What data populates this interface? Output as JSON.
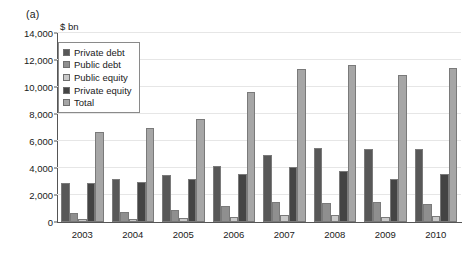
{
  "panel": {
    "label": "(a)",
    "unit_label": "$ bn"
  },
  "colors": {
    "private_debt": "#585858",
    "public_debt": "#8f8f8f",
    "public_equity": "#c9c9c9",
    "private_equity": "#444444",
    "total": "#a6a6a6",
    "axis": "#555555",
    "grid": "#e6e6e6"
  },
  "chart_data": {
    "type": "bar",
    "title": "",
    "subtitle": "",
    "xlabel": "",
    "ylabel": "$ bn",
    "ylim": [
      0,
      14000
    ],
    "yticks": [
      0,
      2000,
      4000,
      6000,
      8000,
      10000,
      12000,
      14000
    ],
    "ytick_labels": [
      "0",
      "2,000",
      "4,000",
      "6,000",
      "8,000",
      "10,000",
      "12,000",
      "14,000"
    ],
    "grid": true,
    "legend_position": "upper-left-inside",
    "categories": [
      "2003",
      "2004",
      "2005",
      "2006",
      "2007",
      "2008",
      "2009",
      "2010"
    ],
    "series": [
      {
        "name": "Private debt",
        "color": "#585858",
        "values": [
          2900,
          3200,
          3500,
          4150,
          5000,
          5450,
          5400,
          5400
        ]
      },
      {
        "name": "Public debt",
        "color": "#8f8f8f",
        "values": [
          700,
          750,
          900,
          1200,
          1500,
          1400,
          1500,
          1300
        ]
      },
      {
        "name": "Public equity",
        "color": "#c9c9c9",
        "values": [
          250,
          250,
          300,
          400,
          550,
          500,
          400,
          450
        ]
      },
      {
        "name": "Private equity",
        "color": "#444444",
        "values": [
          2900,
          3000,
          3200,
          3550,
          4100,
          3800,
          3200,
          3550
        ]
      },
      {
        "name": "Total",
        "color": "#a6a6a6",
        "values": [
          6700,
          6950,
          7600,
          9600,
          11300,
          11600,
          10900,
          11400
        ]
      }
    ]
  },
  "legend": {
    "items": [
      {
        "label": "Private debt"
      },
      {
        "label": "Public debt"
      },
      {
        "label": "Public equity"
      },
      {
        "label": "Private equity"
      },
      {
        "label": "Total"
      }
    ]
  }
}
